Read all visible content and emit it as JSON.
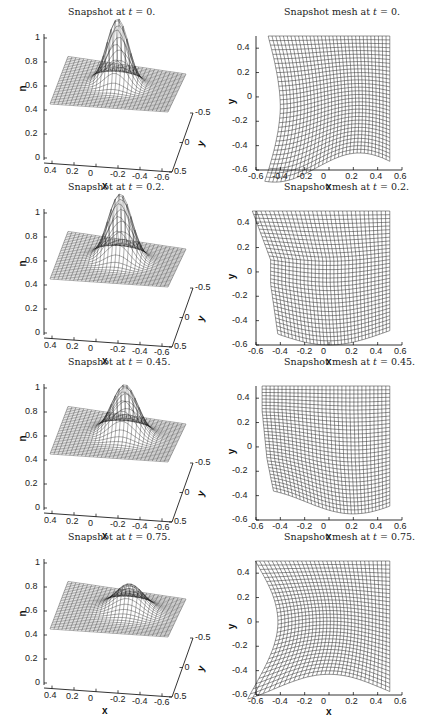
{
  "figure": {
    "panels": [
      {
        "row": 0,
        "kind": "surface",
        "title_prefix": "Snapshot at ",
        "title_var": "t",
        "title_suffix": " = 0.",
        "t": 0,
        "peak": 1.0,
        "peak_x": -0.15
      },
      {
        "row": 0,
        "kind": "mesh",
        "title_prefix": "Snapshot mesh at ",
        "title_var": "t",
        "title_suffix": " = 0.",
        "t": 0
      },
      {
        "row": 1,
        "kind": "surface",
        "title_prefix": "Snapshot at ",
        "title_var": "t",
        "title_suffix": " = 0.2.",
        "t": 0.2,
        "peak": 1.0,
        "peak_x": -0.1
      },
      {
        "row": 1,
        "kind": "mesh",
        "title_prefix": "Snapshot mesh at ",
        "title_var": "t",
        "title_suffix": " = 0.2.",
        "t": 0.2
      },
      {
        "row": 2,
        "kind": "surface",
        "title_prefix": "Snapshot at ",
        "title_var": "t",
        "title_suffix": " = 0.45.",
        "t": 0.45,
        "peak": 0.87,
        "peak_x": 0.0
      },
      {
        "row": 2,
        "kind": "mesh",
        "title_prefix": "Snapshot mesh at ",
        "title_var": "t",
        "title_suffix": " = 0.45.",
        "t": 0.45
      },
      {
        "row": 3,
        "kind": "surface",
        "title_prefix": "Snapshot at ",
        "title_var": "t",
        "title_suffix": " = 0.75.",
        "t": 0.75,
        "peak": 0.67,
        "peak_x": 0.1
      },
      {
        "row": 3,
        "kind": "mesh",
        "title_prefix": "Snapshot mesh at ",
        "title_var": "t",
        "title_suffix": " = 0.75.",
        "t": 0.75
      }
    ],
    "surface_axes": {
      "z_label": "n",
      "x_label": "x",
      "y_label": "y",
      "z_ticks": [
        "0",
        "0.2",
        "0.4",
        "0.6",
        "0.8",
        "1"
      ],
      "x_ticks": [
        "0.4",
        "0.2",
        "0",
        "-0.2",
        "-0.4",
        "-0.6"
      ],
      "y_ticks": [
        "-0.5",
        "0",
        "0.5"
      ]
    },
    "mesh_axes": {
      "x_label": "x",
      "y_label": "y",
      "x_ticks": [
        "-0.6",
        "-0.4",
        "-0.2",
        "0",
        "0.2",
        "0.4",
        "0.6"
      ],
      "y_ticks": [
        "0.4",
        "0.2",
        "0",
        "-0.2",
        "-0.4",
        "-0.6"
      ]
    }
  },
  "chart_data": [
    {
      "type": "surface",
      "title": "Snapshot at t = 0.",
      "xlabel": "x",
      "ylabel": "y",
      "zlabel": "n",
      "zlim": [
        0,
        1
      ],
      "xlim": [
        -0.6,
        0.5
      ],
      "ylim": [
        -0.5,
        0.5
      ],
      "peak_value": 1.0,
      "baseline": 0.5
    },
    {
      "type": "mesh",
      "title": "Snapshot mesh at t = 0.",
      "xlabel": "x",
      "ylabel": "y",
      "xlim": [
        -0.6,
        0.6
      ],
      "ylim": [
        -0.6,
        0.5
      ]
    },
    {
      "type": "surface",
      "title": "Snapshot at t = 0.2.",
      "xlabel": "x",
      "ylabel": "y",
      "zlabel": "n",
      "zlim": [
        0,
        1
      ],
      "xlim": [
        -0.6,
        0.5
      ],
      "ylim": [
        -0.5,
        0.5
      ],
      "peak_value": 1.0,
      "baseline": 0.5
    },
    {
      "type": "mesh",
      "title": "Snapshot mesh at t = 0.2.",
      "xlabel": "x",
      "ylabel": "y",
      "xlim": [
        -0.6,
        0.6
      ],
      "ylim": [
        -0.6,
        0.5
      ]
    },
    {
      "type": "surface",
      "title": "Snapshot at t = 0.45.",
      "xlabel": "x",
      "ylabel": "y",
      "zlabel": "n",
      "zlim": [
        0,
        1
      ],
      "xlim": [
        -0.6,
        0.5
      ],
      "ylim": [
        -0.5,
        0.5
      ],
      "peak_value": 0.87,
      "baseline": 0.5
    },
    {
      "type": "mesh",
      "title": "Snapshot mesh at t = 0.45.",
      "xlabel": "x",
      "ylabel": "y",
      "xlim": [
        -0.6,
        0.6
      ],
      "ylim": [
        -0.6,
        0.5
      ]
    },
    {
      "type": "surface",
      "title": "Snapshot at t = 0.75.",
      "xlabel": "x",
      "ylabel": "y",
      "zlabel": "n",
      "zlim": [
        0,
        1
      ],
      "xlim": [
        -0.6,
        0.5
      ],
      "ylim": [
        -0.5,
        0.5
      ],
      "peak_value": 0.67,
      "baseline": 0.5
    },
    {
      "type": "mesh",
      "title": "Snapshot mesh at t = 0.75.",
      "xlabel": "x",
      "ylabel": "y",
      "xlim": [
        -0.6,
        0.6
      ],
      "ylim": [
        -0.6,
        0.5
      ]
    }
  ]
}
